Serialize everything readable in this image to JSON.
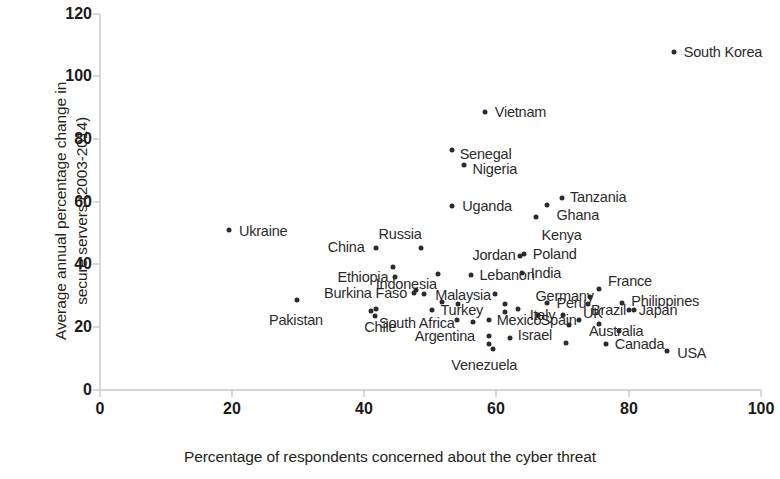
{
  "chart_data": {
    "type": "scatter",
    "title": "",
    "xlabel": "Percentage of respondents concerned about the cyber threat",
    "ylabel_line1": "Average annual percentage change in",
    "ylabel_line2": "secure servers (2003-2014)",
    "xlim": [
      0,
      100
    ],
    "ylim": [
      0,
      120
    ],
    "xticks": [
      0,
      20,
      40,
      60,
      80,
      100
    ],
    "yticks": [
      0,
      20,
      40,
      60,
      80,
      100,
      120
    ],
    "grid": false,
    "legend": "none",
    "marker_color": "#2b2b2b",
    "axis_color": "#c9c9c9",
    "points": [
      {
        "label": "South Korea",
        "x": 86.8,
        "y": 107.8,
        "lx": 10,
        "ly": 0
      },
      {
        "label": "Vietnam",
        "x": 58.2,
        "y": 88.6,
        "lx": 10,
        "ly": 0
      },
      {
        "label": "Senegal",
        "x": 53.2,
        "y": 76.5,
        "lx": 8,
        "ly": 4
      },
      {
        "label": "Nigeria",
        "x": 55.0,
        "y": 71.7,
        "lx": 9,
        "ly": 4
      },
      {
        "label": "Uganda",
        "x": 53.3,
        "y": 58.6,
        "lx": 10,
        "ly": 0
      },
      {
        "label": "Tanzania",
        "x": 69.9,
        "y": 61.4,
        "lx": 8,
        "ly": -1
      },
      {
        "label": "Ghana",
        "x": 67.7,
        "y": 59.2,
        "lx": 9,
        "ly": 10
      },
      {
        "label": "Kenya",
        "x": 65.9,
        "y": 55.1,
        "lx": 6,
        "ly": 18
      },
      {
        "label": "Ukraine",
        "x": 19.5,
        "y": 51.2,
        "lx": 10,
        "ly": 1
      },
      {
        "label": "Russia",
        "x": 48.5,
        "y": 45.4,
        "lx": -42,
        "ly": -14
      },
      {
        "label": "China",
        "x": 41.7,
        "y": 45.4,
        "lx": -48,
        "ly": -1
      },
      {
        "label": "Jordan",
        "x": 63.6,
        "y": 42.8,
        "lx": -48,
        "ly": -1
      },
      {
        "label": "Poland",
        "x": 64.1,
        "y": 43.5,
        "lx": 9,
        "ly": 0
      },
      {
        "label": "Indonesia",
        "x": 51.1,
        "y": 37.1,
        "lx": -62,
        "ly": 10
      },
      {
        "label": "India",
        "x": 63.8,
        "y": 37.4,
        "lx": 9,
        "ly": 0
      },
      {
        "label": "Lebanon",
        "x": 56.2,
        "y": 36.8,
        "lx": 8,
        "ly": 0
      },
      {
        "label": "Ethiopia",
        "x": 44.7,
        "y": 36.1,
        "lx": -58,
        "ly": 0
      },
      {
        "label": "France",
        "x": 75.5,
        "y": 32.1,
        "lx": 9,
        "ly": -8
      },
      {
        "label": "Germany",
        "x": 74.2,
        "y": 29.8,
        "lx": -55,
        "ly": -1
      },
      {
        "label": "Malaysia",
        "x": 59.8,
        "y": 30.5,
        "lx": -60,
        "ly": 1
      },
      {
        "label": "Burkina Faso",
        "x": 47.5,
        "y": 31.1,
        "lx": -90,
        "ly": 0
      },
      {
        "label": "Philippines",
        "x": 79.0,
        "y": 27.7,
        "lx": 9,
        "ly": -2
      },
      {
        "label": "Peru",
        "x": 67.7,
        "y": 27.8,
        "lx": 9,
        "ly": 0
      },
      {
        "label": "Turkey",
        "x": 50.3,
        "y": 25.4,
        "lx": 8,
        "ly": 0
      },
      {
        "label": "Brazil",
        "x": 80.8,
        "y": 25.4,
        "lx": -43,
        "ly": 0
      },
      {
        "label": "Japan",
        "x": 80.0,
        "y": 25.6,
        "lx": 10,
        "ly": 0
      },
      {
        "label": "Italy",
        "x": 70.0,
        "y": 24.0,
        "lx": -33,
        "ly": 0
      },
      {
        "label": "Pakistan",
        "x": 29.8,
        "y": 28.8,
        "lx": -28,
        "ly": 20
      },
      {
        "label": "South Africa",
        "x": 54.0,
        "y": 22.4,
        "lx": -78,
        "ly": 3
      },
      {
        "label": "Mexico",
        "x": 58.8,
        "y": 22.2,
        "lx": 8,
        "ly": 0
      },
      {
        "label": "Spain",
        "x": 72.4,
        "y": 22.2,
        "lx": -38,
        "ly": 0
      },
      {
        "label": "UK",
        "x": 75.5,
        "y": 21.0,
        "lx": -16,
        "ly": -11
      },
      {
        "label": "Chile",
        "x": 41.8,
        "y": 25.7,
        "lx": -12,
        "ly": 18
      },
      {
        "label": "Australia",
        "x": 78.5,
        "y": 18.8,
        "lx": -30,
        "ly": 0
      },
      {
        "label": "Israel",
        "x": 62.0,
        "y": 16.7,
        "lx": 8,
        "ly": -3
      },
      {
        "label": "Argentina",
        "x": 58.8,
        "y": 17.1,
        "lx": -74,
        "ly": 0
      },
      {
        "label": "Canada",
        "x": 76.5,
        "y": 14.7,
        "lx": 9,
        "ly": 0
      },
      {
        "label": "USA",
        "x": 85.8,
        "y": 12.5,
        "lx": 10,
        "ly": 2
      },
      {
        "label": "Venezuela",
        "x": 59.5,
        "y": 13.0,
        "lx": -42,
        "ly": 16
      }
    ],
    "extra_points": [
      {
        "x": 44.3,
        "y": 39.1
      },
      {
        "x": 47.8,
        "y": 32.0
      },
      {
        "x": 49.0,
        "y": 30.5
      },
      {
        "x": 51.8,
        "y": 28.0
      },
      {
        "x": 54.2,
        "y": 27.4
      },
      {
        "x": 41.0,
        "y": 25.1
      },
      {
        "x": 41.6,
        "y": 23.7
      },
      {
        "x": 61.2,
        "y": 27.6
      },
      {
        "x": 61.2,
        "y": 25.0
      },
      {
        "x": 63.2,
        "y": 25.9
      },
      {
        "x": 66.2,
        "y": 23.8
      },
      {
        "x": 56.4,
        "y": 21.6
      },
      {
        "x": 58.9,
        "y": 14.6
      },
      {
        "x": 70.9,
        "y": 20.9
      },
      {
        "x": 73.8,
        "y": 27.4
      },
      {
        "x": 70.5,
        "y": 15.0
      }
    ]
  }
}
